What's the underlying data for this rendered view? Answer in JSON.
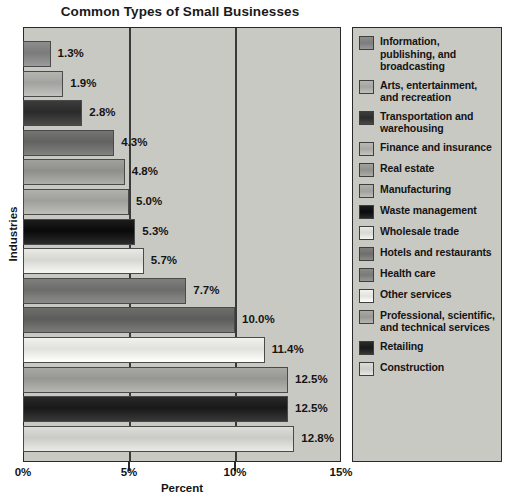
{
  "chart_data": {
    "type": "bar",
    "orientation": "horizontal",
    "title": "Common Types of Small Businesses",
    "xlabel": "Percent",
    "ylabel": "Industries",
    "xlim": [
      0,
      15
    ],
    "xticks": [
      "0%",
      "5%",
      "10%",
      "15%"
    ],
    "xtick_values": [
      0,
      5,
      10,
      15
    ],
    "grid": true,
    "legend_position": "right",
    "value_suffix": "%",
    "categories": [
      "Information, publishing, and broadcasting",
      "Arts, entertainment, and recreation",
      "Transportation and warehousing",
      "Finance and insurance",
      "Real estate",
      "Manufacturing",
      "Waste management",
      "Wholesale trade",
      "Hotels and restaurants",
      "Health care",
      "Other services",
      "Professional, scientific, and technical services",
      "Retailing",
      "Construction"
    ],
    "values": [
      1.3,
      1.9,
      2.8,
      4.3,
      4.8,
      5.0,
      5.3,
      5.7,
      7.7,
      10.0,
      11.4,
      12.5,
      12.5,
      12.8
    ],
    "value_labels": [
      "1.3%",
      "1.9%",
      "2.8%",
      "4.3%",
      "4.8%",
      "5.0%",
      "5.3%",
      "5.7%",
      "7.7%",
      "10.0%",
      "11.4%",
      "12.5%",
      "12.5%",
      "12.8%"
    ],
    "bar_colors": [
      "#8d8d8d",
      "#b4b4b0",
      "#3c3c3c",
      "#747472",
      "#a0a09c",
      "#b0b0ac",
      "#1c1c1c",
      "#e8e8e4",
      "#7e7e7c",
      "#6e6e6c",
      "#f2f2ee",
      "#a8a8a4",
      "#2a2a2a",
      "#dcdcd8"
    ],
    "plot_background": "#c9c9c4",
    "frame_color": "#2a2a2a"
  },
  "legend": {
    "items": [
      {
        "label": "Information, publishing, and broadcasting",
        "swatch": "#8d8d8d"
      },
      {
        "label": "Arts, entertainment, and recreation",
        "swatch": "#b4b4b0"
      },
      {
        "label": "Transportation and warehousing",
        "swatch": "#3c3c3c"
      },
      {
        "label": "Finance and insurance",
        "swatch": "#b8b8b4"
      },
      {
        "label": "Real estate",
        "swatch": "#a0a09c"
      },
      {
        "label": "Manufacturing",
        "swatch": "#b0b0ac"
      },
      {
        "label": "Waste management",
        "swatch": "#1c1c1c"
      },
      {
        "label": "Wholesale trade",
        "swatch": "#e8e8e4"
      },
      {
        "label": "Hotels and restaurants",
        "swatch": "#7e7e7c"
      },
      {
        "label": "Health care",
        "swatch": "#8a8a88"
      },
      {
        "label": "Other services",
        "swatch": "#f2f2ee"
      },
      {
        "label": "Professional, scientific, and technical services",
        "swatch": "#a8a8a4"
      },
      {
        "label": "Retailing",
        "swatch": "#2a2a2a"
      },
      {
        "label": "Construction",
        "swatch": "#dcdcd8"
      }
    ]
  }
}
